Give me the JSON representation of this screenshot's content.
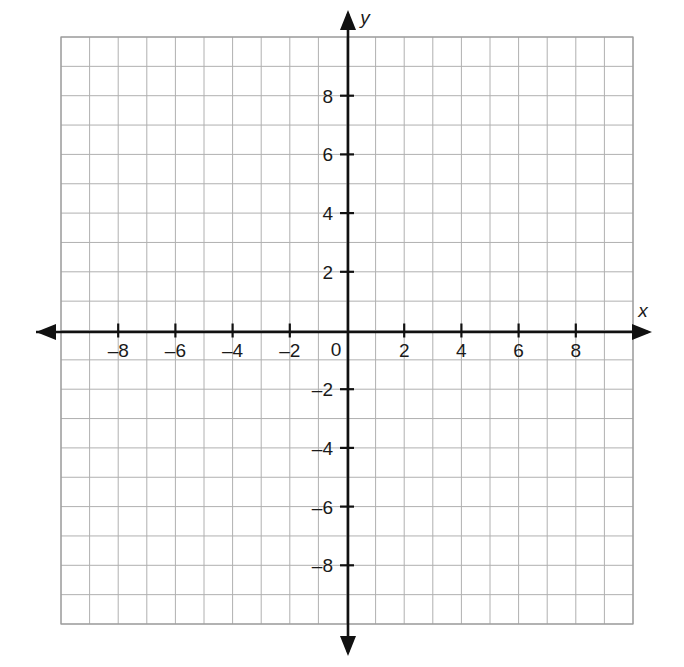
{
  "figure": {
    "kind": "blank-cartesian-coordinate-plane",
    "background_color": "#ffffff"
  },
  "chart_data": {
    "type": "scatter",
    "title": "",
    "xlabel": "x",
    "ylabel": "y",
    "xlim": [
      -10,
      10
    ],
    "ylim": [
      -10,
      10
    ],
    "grid": true,
    "grid_step": 1,
    "tick_step": 2,
    "legend": "none",
    "series": [],
    "x_tick_values": [
      -8,
      -6,
      -4,
      -2,
      0,
      2,
      4,
      6,
      8
    ],
    "y_tick_values": [
      -8,
      -6,
      -4,
      -2,
      2,
      4,
      6,
      8
    ],
    "x_tick_labels": [
      "–8",
      "–6",
      "–4",
      "–2",
      "0",
      "2",
      "4",
      "6",
      "8"
    ],
    "y_tick_labels": [
      "–8",
      "–6",
      "–4",
      "–2",
      "2",
      "4",
      "6",
      "8"
    ],
    "annotations": [],
    "data_points": []
  },
  "axes": {
    "x_axis": {
      "name": "x",
      "label_text": "x",
      "arrow_left": "◀",
      "arrow_right": "▶",
      "color": "#111111"
    },
    "y_axis": {
      "name": "y",
      "label_text": "y",
      "arrow_up": "▲",
      "arrow_down": "▼",
      "color": "#111111"
    },
    "origin_label": "0"
  },
  "grid": {
    "line_color": "#b0b0b0",
    "border_color": "#9a9a9a",
    "columns": 20,
    "rows": 20
  },
  "ticks": {
    "x": [
      {
        "value": -8,
        "label": "–8"
      },
      {
        "value": -6,
        "label": "–6"
      },
      {
        "value": -4,
        "label": "–4"
      },
      {
        "value": -2,
        "label": "–2"
      },
      {
        "value": 2,
        "label": "2"
      },
      {
        "value": 4,
        "label": "4"
      },
      {
        "value": 6,
        "label": "6"
      },
      {
        "value": 8,
        "label": "8"
      }
    ],
    "y": [
      {
        "value": 8,
        "label": "8"
      },
      {
        "value": 6,
        "label": "6"
      },
      {
        "value": 4,
        "label": "4"
      },
      {
        "value": 2,
        "label": "2"
      },
      {
        "value": -2,
        "label": "–2"
      },
      {
        "value": -4,
        "label": "–4"
      },
      {
        "value": -6,
        "label": "–6"
      },
      {
        "value": -8,
        "label": "–8"
      }
    ]
  }
}
